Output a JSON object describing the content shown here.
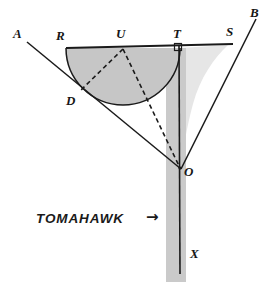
{
  "figure": {
    "caption": {
      "text": "TOMAHAWK",
      "arrow": "→"
    },
    "colors": {
      "stroke": "#1a1a1a",
      "semicircle_fill": "#c6c6c6",
      "handle_fill": "#c9c9c9",
      "pale_fill": "#e3e3e3",
      "background": "#ffffff"
    },
    "points": [
      {
        "id": "A",
        "label": "A",
        "x": 28,
        "y": 42
      },
      {
        "id": "R",
        "label": "R",
        "x": 68,
        "y": 48
      },
      {
        "id": "U",
        "label": "U",
        "x": 123,
        "y": 48
      },
      {
        "id": "T",
        "label": "T",
        "x": 180,
        "y": 48
      },
      {
        "id": "S",
        "label": "S",
        "x": 231,
        "y": 44
      },
      {
        "id": "B",
        "label": "B",
        "x": 255,
        "y": 17
      },
      {
        "id": "D",
        "label": "D",
        "x": 80,
        "y": 91
      },
      {
        "id": "O",
        "label": "O",
        "x": 180,
        "y": 168
      },
      {
        "id": "X",
        "label": "X",
        "x": 180,
        "y": 270
      }
    ],
    "point_labels": [
      {
        "name": "label-A",
        "text": "A",
        "left": 13,
        "top": 28
      },
      {
        "name": "label-R",
        "text": "R",
        "left": 56,
        "top": 30
      },
      {
        "name": "label-U",
        "text": "U",
        "left": 115,
        "top": 28
      },
      {
        "name": "label-T",
        "text": "T",
        "left": 172,
        "top": 28
      },
      {
        "name": "label-S",
        "text": "S",
        "left": 225,
        "top": 28
      },
      {
        "name": "label-B",
        "text": "B",
        "left": 250,
        "top": 8
      },
      {
        "name": "label-D",
        "text": "D",
        "left": 68,
        "top": 94
      },
      {
        "name": "label-O",
        "text": "O",
        "left": 183,
        "top": 166
      },
      {
        "name": "label-X",
        "text": "X",
        "left": 190,
        "top": 248
      }
    ],
    "semicircle": {
      "center_x": 123,
      "center_y": 48,
      "radius": 57,
      "description": "semicircular head of the tomahawk, diameter on line RS"
    },
    "segments": [
      {
        "name": "ray-AO",
        "from": "A",
        "to": "O",
        "style": "solid",
        "note": "first arm of the trisected angle, passes through D"
      },
      {
        "name": "ray-OB",
        "from": "O",
        "to": "B",
        "style": "solid",
        "note": "second arm of the trisected angle, passes through S"
      },
      {
        "name": "line-RS",
        "from": "R",
        "to": "S",
        "style": "solid",
        "note": "top edge / diameter line of the head"
      },
      {
        "name": "shaft-TX",
        "from": "T",
        "to": "X",
        "style": "solid",
        "note": "handle of the tomahawk, perpendicular to RS at T"
      },
      {
        "name": "dashed-UD",
        "from": "U",
        "to": "D",
        "style": "dashed",
        "note": "radius to tangency point D"
      },
      {
        "name": "dashed-UO",
        "from": "U",
        "to": "O",
        "style": "dashed",
        "note": "trisecting construction line"
      }
    ],
    "markers": [
      {
        "name": "right-angle-at-T",
        "x": 180,
        "y": 48,
        "size": 7,
        "note": "square marker showing TX perpendicular to RS"
      }
    ],
    "caption_position": {
      "text_left": 36,
      "text_top": 212,
      "arrow_left": 144,
      "arrow_top": 211
    }
  }
}
